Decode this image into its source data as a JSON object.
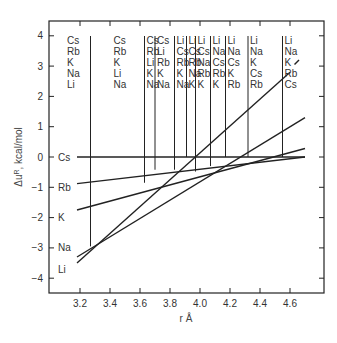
{
  "chart_data": {
    "type": "line",
    "title": "",
    "xlabel": "r  Å",
    "ylabel": "Δu^R, kcal/mol",
    "xlim": [
      3.15,
      4.75
    ],
    "ylim": [
      -4.5,
      4.5
    ],
    "x_ticks": [
      "3.2",
      "3.4",
      "3.6",
      "3.8",
      "4.0",
      "4.2",
      "4.4",
      "4.6"
    ],
    "y_ticks": [
      "4",
      "3",
      "2",
      "1",
      "0",
      "-1",
      "-2",
      "-3",
      "-4"
    ],
    "grid": false,
    "series": [
      {
        "name": "Cs",
        "x": [
          3.18,
          4.7
        ],
        "values": [
          0.0,
          0.0
        ]
      },
      {
        "name": "Rb",
        "x": [
          3.18,
          4.7
        ],
        "values": [
          -0.88,
          0.0
        ]
      },
      {
        "name": "K",
        "x": [
          3.18,
          4.7
        ],
        "values": [
          -1.75,
          0.28
        ]
      },
      {
        "name": "Na",
        "x": [
          3.18,
          4.7
        ],
        "values": [
          -3.3,
          1.3
        ]
      },
      {
        "name": "Li",
        "x": [
          3.18,
          4.6
        ],
        "values": [
          -3.5,
          2.8
        ]
      }
    ],
    "left_labels": [
      {
        "text": "Cs",
        "y": 0
      },
      {
        "text": "Rb",
        "y": -1
      },
      {
        "text": "K",
        "y": -2
      },
      {
        "text": "Na",
        "y": -3
      },
      {
        "text": "Li",
        "y": -3.5
      }
    ],
    "region_dividers_r": [
      3.27,
      3.63,
      3.7,
      3.83,
      3.91,
      3.97,
      4.07,
      4.17,
      4.32,
      4.55
    ],
    "region_orderings": [
      [
        "Cs",
        "Rb",
        "K",
        "Na",
        "Li"
      ],
      [
        "Cs",
        "Rb",
        "K",
        "Li",
        "Na"
      ],
      [
        "Cs",
        "Rb",
        "Li",
        "K",
        "Na"
      ],
      [
        "Cs",
        "Li",
        "Rb",
        "K",
        "Na"
      ],
      [
        "Li",
        "Cs",
        "Rb",
        "K",
        "Na"
      ],
      [
        "Li",
        "Cs",
        "Rb",
        "Na",
        "K"
      ],
      [
        "Li",
        "Cs",
        "Na",
        "Rb",
        "K"
      ],
      [
        "Li",
        "Na",
        "Cs",
        "Rb",
        "K"
      ],
      [
        "Li",
        "Na",
        "Cs",
        "K",
        "Rb"
      ],
      [
        "Li",
        "Na",
        "K",
        "Cs",
        "Rb"
      ],
      [
        "Li",
        "Na",
        "K",
        "Rb",
        "Cs"
      ]
    ]
  }
}
